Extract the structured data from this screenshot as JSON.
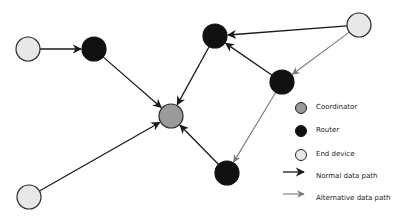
{
  "colors": {
    "coordinator": "#9a9a9a",
    "router": "#111111",
    "end_device": "#e8e8e8",
    "normal_path": "#1a1a1a",
    "alternative_path": "#7a7a7a"
  },
  "nodes": [
    {
      "id": "A",
      "type": "end_device",
      "x": 28,
      "y": 49
    },
    {
      "id": "B",
      "type": "router",
      "x": 94,
      "y": 49
    },
    {
      "id": "C",
      "type": "coordinator",
      "x": 171,
      "y": 116
    },
    {
      "id": "D",
      "type": "router",
      "x": 215,
      "y": 36
    },
    {
      "id": "E",
      "type": "end_device",
      "x": 359,
      "y": 25
    },
    {
      "id": "F",
      "type": "router",
      "x": 282,
      "y": 82
    },
    {
      "id": "G",
      "type": "router",
      "x": 227,
      "y": 173
    },
    {
      "id": "H",
      "type": "end_device",
      "x": 29,
      "y": 197
    }
  ],
  "edges": [
    {
      "from": "A",
      "to": "B",
      "kind": "normal"
    },
    {
      "from": "B",
      "to": "C",
      "kind": "normal"
    },
    {
      "from": "D",
      "to": "C",
      "kind": "normal"
    },
    {
      "from": "E",
      "to": "D",
      "kind": "normal"
    },
    {
      "from": "F",
      "to": "D",
      "kind": "normal"
    },
    {
      "from": "E",
      "to": "F",
      "kind": "alternative"
    },
    {
      "from": "F",
      "to": "G",
      "kind": "alternative"
    },
    {
      "from": "G",
      "to": "C",
      "kind": "normal"
    },
    {
      "from": "H",
      "to": "C",
      "kind": "normal"
    }
  ],
  "legend": {
    "coordinator": "Coordinator",
    "router": "Router",
    "end_device": "End device",
    "normal_path": "Normal data path",
    "alternative_path": "Alternative data path"
  }
}
